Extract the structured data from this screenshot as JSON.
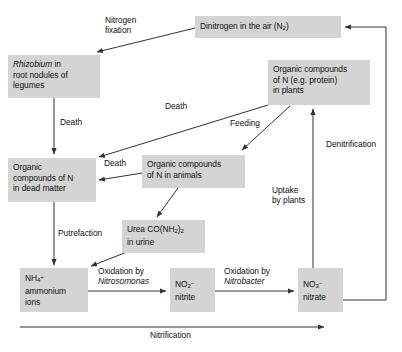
{
  "diagram": {
    "style": {
      "box_fill": "#d4d4d4",
      "text_color": "#111111",
      "line_color": "#333333",
      "background": "#ffffff"
    },
    "nodes": [
      {
        "id": "dinitrogen",
        "label": "Dinitrogen in the air (N2)",
        "label_main": "Dinitrogen in the air (N",
        "label_sub": "2",
        "label_tail": ")"
      },
      {
        "id": "rhizobium",
        "line1_italic": "Rhizobium",
        "line1_rest": " in",
        "line2": "root nodules of",
        "line3": "legumes"
      },
      {
        "id": "plants",
        "line1": "Organic compounds",
        "line2": "of N (e.g. protein)",
        "line3": "in plants"
      },
      {
        "id": "dead-matter",
        "line1": "Organic",
        "line2": "compounds of N",
        "line3": "in dead matter"
      },
      {
        "id": "animals",
        "line1": "Organic compounds",
        "line2": "of N in animals"
      },
      {
        "id": "urea",
        "line1_pre": "Urea CO(NH",
        "line1_sub": "2",
        "line1_mid": ")",
        "line1_sub2": "2",
        "line2": "in urine"
      },
      {
        "id": "ammonium",
        "formula_main": "NH",
        "formula_sub": "4",
        "formula_sup": "+",
        "line2": "ammonium",
        "line3": "ions"
      },
      {
        "id": "nitrite",
        "formula_main": "NO",
        "formula_sub": "2",
        "formula_sup": "–",
        "line2": "nitrite"
      },
      {
        "id": "nitrate",
        "formula_main": "NO",
        "formula_sub": "3",
        "formula_sup": "–",
        "line2": "nitrate"
      }
    ],
    "edge_labels": [
      {
        "id": "nitrogen-fixation",
        "line1": "Nitrogen",
        "line2": "fixation"
      },
      {
        "id": "death-rhizobium",
        "text": "Death"
      },
      {
        "id": "death-plants",
        "text": "Death"
      },
      {
        "id": "death-animals",
        "text": "Death"
      },
      {
        "id": "feeding",
        "text": "Feeding"
      },
      {
        "id": "denitrification",
        "text": "Denitrification"
      },
      {
        "id": "uptake-by-plants",
        "line1": "Uptake",
        "line2": "by plants"
      },
      {
        "id": "putrefaction",
        "text": "Putrefaction"
      },
      {
        "id": "oxidation-nitrosomonas",
        "line1": "Oxidation by",
        "line2_italic": "Nitrosomonas"
      },
      {
        "id": "oxidation-nitrobacter",
        "line1": "Oxidation by",
        "line2_italic": "Nitrobacter"
      },
      {
        "id": "nitrification",
        "text": "Nitrification"
      }
    ]
  }
}
